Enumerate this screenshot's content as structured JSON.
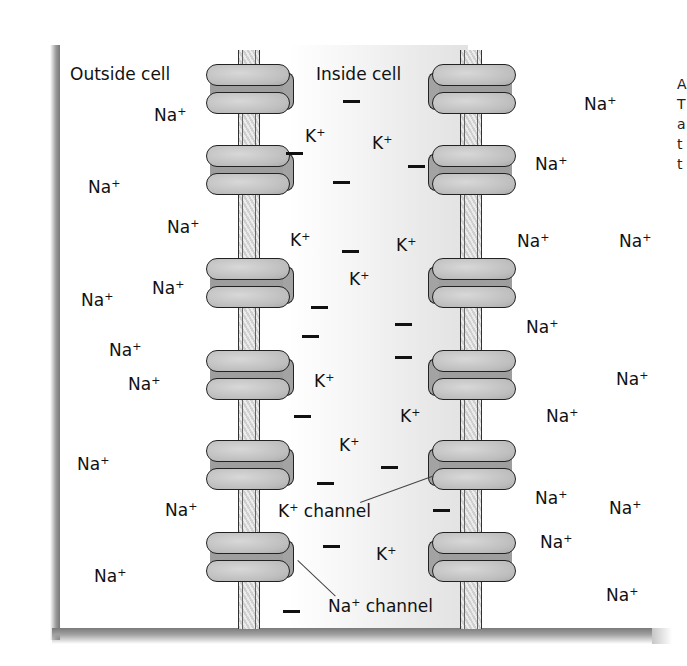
{
  "diagram": {
    "headings": [
      {
        "id": "outside",
        "text": "Outside cell",
        "x": 70,
        "y": 66
      },
      {
        "id": "inside",
        "text": "Inside cell",
        "x": 316,
        "y": 66
      }
    ],
    "callouts": [
      {
        "id": "k-channel",
        "text": "K",
        "sup": "+",
        "rest": " channel",
        "x": 278,
        "y": 502,
        "line": {
          "x1": 360,
          "y1": 502,
          "x2": 432,
          "y2": 476
        }
      },
      {
        "id": "na-channel",
        "text": "Na",
        "sup": "+",
        "rest": " channel",
        "x": 328,
        "y": 597,
        "line": {
          "x1": 298,
          "y1": 560,
          "x2": 336,
          "y2": 596
        }
      }
    ],
    "ions_outside_left": [
      {
        "ion": "Na",
        "charge": "+",
        "x": 154,
        "y": 106
      },
      {
        "ion": "Na",
        "charge": "+",
        "x": 88,
        "y": 178
      },
      {
        "ion": "Na",
        "charge": "+",
        "x": 167,
        "y": 218
      },
      {
        "ion": "Na",
        "charge": "+",
        "x": 152,
        "y": 279
      },
      {
        "ion": "Na",
        "charge": "+",
        "x": 81,
        "y": 291
      },
      {
        "ion": "Na",
        "charge": "+",
        "x": 109,
        "y": 341
      },
      {
        "ion": "Na",
        "charge": "+",
        "x": 128,
        "y": 375
      },
      {
        "ion": "Na",
        "charge": "+",
        "x": 77,
        "y": 455
      },
      {
        "ion": "Na",
        "charge": "+",
        "x": 165,
        "y": 501
      },
      {
        "ion": "Na",
        "charge": "+",
        "x": 94,
        "y": 567
      }
    ],
    "ions_inside": [
      {
        "ion": "K",
        "charge": "+",
        "x": 305,
        "y": 127
      },
      {
        "ion": "K",
        "charge": "+",
        "x": 372,
        "y": 134
      },
      {
        "ion": "K",
        "charge": "+",
        "x": 290,
        "y": 231
      },
      {
        "ion": "K",
        "charge": "+",
        "x": 396,
        "y": 236
      },
      {
        "ion": "K",
        "charge": "+",
        "x": 349,
        "y": 270
      },
      {
        "ion": "K",
        "charge": "+",
        "x": 314,
        "y": 372
      },
      {
        "ion": "K",
        "charge": "+",
        "x": 400,
        "y": 407
      },
      {
        "ion": "K",
        "charge": "+",
        "x": 339,
        "y": 436
      },
      {
        "ion": "K",
        "charge": "+",
        "x": 376,
        "y": 545
      }
    ],
    "ions_outside_right": [
      {
        "ion": "Na",
        "charge": "+",
        "x": 584,
        "y": 95
      },
      {
        "ion": "Na",
        "charge": "+",
        "x": 535,
        "y": 155
      },
      {
        "ion": "Na",
        "charge": "+",
        "x": 517,
        "y": 232
      },
      {
        "ion": "Na",
        "charge": "+",
        "x": 619,
        "y": 232
      },
      {
        "ion": "Na",
        "charge": "+",
        "x": 526,
        "y": 318
      },
      {
        "ion": "Na",
        "charge": "+",
        "x": 616,
        "y": 370
      },
      {
        "ion": "Na",
        "charge": "+",
        "x": 546,
        "y": 407
      },
      {
        "ion": "Na",
        "charge": "+",
        "x": 535,
        "y": 489
      },
      {
        "ion": "Na",
        "charge": "+",
        "x": 609,
        "y": 499
      },
      {
        "ion": "Na",
        "charge": "+",
        "x": 540,
        "y": 533
      },
      {
        "ion": "Na",
        "charge": "+",
        "x": 606,
        "y": 586
      }
    ],
    "negative_charges": [
      {
        "x": 343,
        "y": 100
      },
      {
        "x": 286,
        "y": 152
      },
      {
        "x": 408,
        "y": 165
      },
      {
        "x": 333,
        "y": 181
      },
      {
        "x": 342,
        "y": 250
      },
      {
        "x": 311,
        "y": 306
      },
      {
        "x": 395,
        "y": 323
      },
      {
        "x": 302,
        "y": 335
      },
      {
        "x": 395,
        "y": 356
      },
      {
        "x": 294,
        "y": 415
      },
      {
        "x": 381,
        "y": 466
      },
      {
        "x": 317,
        "y": 482
      },
      {
        "x": 433,
        "y": 509
      },
      {
        "x": 323,
        "y": 545
      },
      {
        "x": 283,
        "y": 610
      }
    ],
    "membranes": [
      {
        "id": "left",
        "x": 238
      },
      {
        "id": "right",
        "x": 460
      }
    ],
    "channels_left": [
      {
        "type": "Na",
        "y": 64
      },
      {
        "type": "Na",
        "y": 145
      },
      {
        "type": "Na",
        "y": 258
      },
      {
        "type": "Na",
        "y": 350
      },
      {
        "type": "Na",
        "y": 440
      },
      {
        "type": "Na",
        "y": 532
      }
    ],
    "channels_right": [
      {
        "type": "K",
        "y": 64
      },
      {
        "type": "K",
        "y": 145
      },
      {
        "type": "K",
        "y": 258
      },
      {
        "type": "K",
        "y": 350
      },
      {
        "type": "K",
        "y": 440
      },
      {
        "type": "K",
        "y": 532
      }
    ],
    "clipped_text_right_edge": [
      "A",
      "T",
      "a",
      "t",
      "t"
    ],
    "colors": {
      "ink": "#111111",
      "channel_fill": "#bdbdbd",
      "membrane_fill": "#d9d9d9",
      "inside_shade": "#e6e6e6",
      "frame_shadow": "#8a8a8a"
    }
  }
}
